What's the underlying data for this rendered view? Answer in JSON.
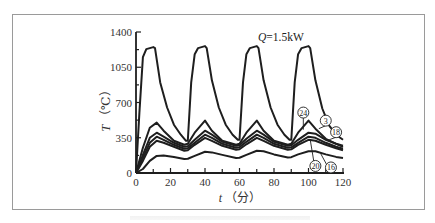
{
  "chart_data": {
    "type": "line",
    "title": "",
    "annotation": "Q=1.5kW",
    "xlabel": "t（分）",
    "ylabel": "T（℃）",
    "xlim": [
      0,
      120
    ],
    "ylim": [
      0,
      1400
    ],
    "xticks": [
      0,
      20,
      40,
      60,
      80,
      100,
      120
    ],
    "yticks": [
      0,
      350,
      700,
      1050,
      1400
    ],
    "grid": false,
    "legend": "inline circled labels",
    "series": [
      {
        "name": "heater",
        "label": "",
        "points": [
          [
            0,
            0
          ],
          [
            2,
            600
          ],
          [
            4,
            1150
          ],
          [
            6,
            1230
          ],
          [
            10,
            1250
          ],
          [
            11,
            1240
          ],
          [
            14,
            900
          ],
          [
            18,
            650
          ],
          [
            22,
            480
          ],
          [
            26,
            380
          ],
          [
            29,
            320
          ],
          [
            30,
            320
          ],
          [
            32,
            900
          ],
          [
            34,
            1180
          ],
          [
            36,
            1240
          ],
          [
            40,
            1260
          ],
          [
            41,
            1240
          ],
          [
            44,
            920
          ],
          [
            48,
            650
          ],
          [
            52,
            480
          ],
          [
            56,
            380
          ],
          [
            59,
            330
          ],
          [
            60,
            330
          ],
          [
            62,
            900
          ],
          [
            64,
            1180
          ],
          [
            66,
            1240
          ],
          [
            70,
            1260
          ],
          [
            71,
            1240
          ],
          [
            74,
            920
          ],
          [
            78,
            650
          ],
          [
            82,
            480
          ],
          [
            86,
            380
          ],
          [
            89,
            330
          ],
          [
            90,
            330
          ],
          [
            92,
            900
          ],
          [
            94,
            1180
          ],
          [
            96,
            1240
          ],
          [
            100,
            1260
          ],
          [
            101,
            1240
          ],
          [
            104,
            920
          ],
          [
            108,
            640
          ],
          [
            112,
            470
          ],
          [
            116,
            380
          ],
          [
            120,
            330
          ]
        ]
      },
      {
        "name": "24",
        "label": "24",
        "points": [
          [
            0,
            0
          ],
          [
            4,
            250
          ],
          [
            8,
            450
          ],
          [
            12,
            500
          ],
          [
            16,
            420
          ],
          [
            22,
            320
          ],
          [
            28,
            280
          ],
          [
            30,
            290
          ],
          [
            34,
            400
          ],
          [
            40,
            520
          ],
          [
            44,
            420
          ],
          [
            50,
            320
          ],
          [
            58,
            280
          ],
          [
            60,
            290
          ],
          [
            64,
            400
          ],
          [
            70,
            520
          ],
          [
            74,
            420
          ],
          [
            80,
            320
          ],
          [
            88,
            280
          ],
          [
            90,
            290
          ],
          [
            94,
            400
          ],
          [
            100,
            520
          ],
          [
            104,
            440
          ],
          [
            110,
            340
          ],
          [
            116,
            290
          ],
          [
            120,
            260
          ]
        ]
      },
      {
        "name": "3",
        "label": "3",
        "points": [
          [
            0,
            0
          ],
          [
            4,
            180
          ],
          [
            8,
            350
          ],
          [
            12,
            400
          ],
          [
            16,
            360
          ],
          [
            22,
            300
          ],
          [
            28,
            260
          ],
          [
            30,
            265
          ],
          [
            34,
            330
          ],
          [
            40,
            420
          ],
          [
            44,
            380
          ],
          [
            50,
            310
          ],
          [
            58,
            270
          ],
          [
            60,
            275
          ],
          [
            64,
            340
          ],
          [
            70,
            420
          ],
          [
            74,
            380
          ],
          [
            80,
            310
          ],
          [
            88,
            270
          ],
          [
            90,
            275
          ],
          [
            94,
            330
          ],
          [
            100,
            400
          ],
          [
            104,
            390
          ],
          [
            110,
            330
          ],
          [
            116,
            290
          ],
          [
            120,
            270
          ]
        ]
      },
      {
        "name": "18",
        "label": "18",
        "points": [
          [
            0,
            0
          ],
          [
            4,
            150
          ],
          [
            8,
            300
          ],
          [
            12,
            360
          ],
          [
            16,
            330
          ],
          [
            22,
            280
          ],
          [
            28,
            240
          ],
          [
            30,
            245
          ],
          [
            34,
            300
          ],
          [
            40,
            380
          ],
          [
            44,
            350
          ],
          [
            50,
            290
          ],
          [
            58,
            250
          ],
          [
            60,
            255
          ],
          [
            64,
            310
          ],
          [
            70,
            380
          ],
          [
            74,
            350
          ],
          [
            80,
            290
          ],
          [
            88,
            250
          ],
          [
            90,
            255
          ],
          [
            94,
            300
          ],
          [
            100,
            360
          ],
          [
            104,
            350
          ],
          [
            110,
            300
          ],
          [
            116,
            260
          ],
          [
            120,
            240
          ]
        ]
      },
      {
        "name": "20",
        "label": "20",
        "points": [
          [
            0,
            0
          ],
          [
            4,
            120
          ],
          [
            8,
            260
          ],
          [
            12,
            320
          ],
          [
            16,
            300
          ],
          [
            22,
            260
          ],
          [
            28,
            220
          ],
          [
            30,
            225
          ],
          [
            34,
            280
          ],
          [
            40,
            350
          ],
          [
            44,
            320
          ],
          [
            50,
            270
          ],
          [
            58,
            230
          ],
          [
            60,
            235
          ],
          [
            64,
            285
          ],
          [
            70,
            350
          ],
          [
            74,
            320
          ],
          [
            80,
            270
          ],
          [
            88,
            230
          ],
          [
            90,
            235
          ],
          [
            94,
            280
          ],
          [
            100,
            330
          ],
          [
            104,
            320
          ],
          [
            110,
            280
          ],
          [
            116,
            245
          ],
          [
            120,
            225
          ]
        ]
      },
      {
        "name": "16",
        "label": "16",
        "points": [
          [
            0,
            0
          ],
          [
            4,
            40
          ],
          [
            8,
            120
          ],
          [
            12,
            170
          ],
          [
            16,
            175
          ],
          [
            22,
            160
          ],
          [
            28,
            140
          ],
          [
            30,
            142
          ],
          [
            34,
            170
          ],
          [
            40,
            210
          ],
          [
            44,
            205
          ],
          [
            50,
            180
          ],
          [
            58,
            150
          ],
          [
            60,
            152
          ],
          [
            64,
            180
          ],
          [
            70,
            220
          ],
          [
            74,
            215
          ],
          [
            80,
            185
          ],
          [
            88,
            155
          ],
          [
            90,
            157
          ],
          [
            94,
            185
          ],
          [
            100,
            215
          ],
          [
            104,
            215
          ],
          [
            110,
            185
          ],
          [
            116,
            160
          ],
          [
            120,
            150
          ]
        ]
      }
    ],
    "label_positions": [
      {
        "label": "24",
        "t": 97,
        "T": 600
      },
      {
        "label": "3",
        "t": 110,
        "T": 520
      },
      {
        "label": "18",
        "t": 116,
        "T": 405
      },
      {
        "label": "20",
        "t": 104,
        "T": 70
      },
      {
        "label": "16",
        "t": 113,
        "T": 55
      }
    ]
  },
  "axes": {
    "x_title": "t（分）",
    "y_title": "T（℃）",
    "x_tick_labels": [
      "0",
      "20",
      "40",
      "60",
      "80",
      "100",
      "120"
    ],
    "y_tick_labels": [
      "0",
      "350",
      "700",
      "1050",
      "1400"
    ]
  },
  "style": {
    "line_color": "#1e1e1e",
    "frame_color": "#9a9a9a",
    "background": "#ffffff"
  }
}
